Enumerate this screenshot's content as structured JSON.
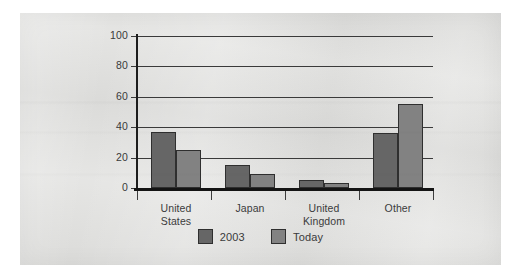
{
  "chart_data": {
    "type": "bar",
    "title": "",
    "subtitle": "",
    "xlabel": "",
    "ylabel": "",
    "ylim": [
      0,
      100
    ],
    "yticks": [
      0,
      20,
      40,
      60,
      80,
      100
    ],
    "grid": true,
    "legend_position": "bottom-center",
    "categories": [
      "United States",
      "Japan",
      "United Kingdom",
      "Other"
    ],
    "category_lines": [
      [
        "United",
        "States"
      ],
      [
        "Japan"
      ],
      [
        "United",
        "Kingdom"
      ],
      [
        "Other"
      ]
    ],
    "series": [
      {
        "name": "2003",
        "color": "#666666",
        "values": [
          37,
          15,
          5,
          36
        ]
      },
      {
        "name": "Today",
        "color": "#828282",
        "values": [
          25,
          9,
          3,
          55
        ]
      }
    ]
  },
  "colors": {
    "page_background": "#ffffff",
    "panel_background": "#e2e2e0",
    "axis": "#1d1d1d",
    "gridline": "#3a3a3a",
    "text": "#3b3b3c",
    "series_2003": "#666666",
    "series_today": "#828282",
    "bar_outline": "#2f2f2f"
  }
}
